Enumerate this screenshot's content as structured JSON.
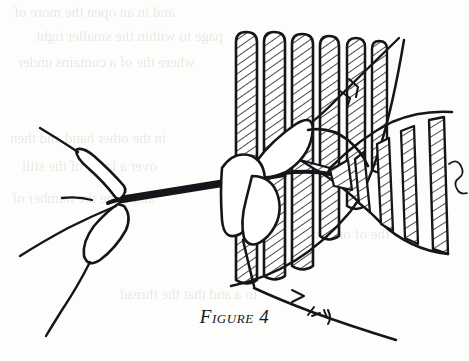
{
  "page": {
    "width": 469,
    "height": 361,
    "paper_color": "#fdfdfc",
    "ink_color": "#16161a",
    "hatch_color": "#2a2a2c"
  },
  "figure": {
    "caption": "Figure 4",
    "caption_number": "4",
    "caption_word": "Figure",
    "alt": "Line drawing of two hands pulling a dark cord through a row of hatched vertical rods",
    "elements": {
      "comb_rods_label": "vertical hatched rods",
      "fan_panel_label": "fanned hatched panel",
      "cord_label": "dark cord",
      "left_hand_label": "left hand fingers",
      "right_hand_label": "right hand fingers",
      "bristle_label": "bristle tick marks",
      "squiggle_label": "loose thread squiggle"
    }
  },
  "ghost_text": {
    "note": "faint bleed-through text from reverse of page",
    "lines": [
      {
        "text": "and  in  an  open  the  more  of",
        "x": 14,
        "y": 4,
        "size": 15
      },
      {
        "text": "page  to  within  the  smaller  tight",
        "x": 36,
        "y": 28,
        "size": 15
      },
      {
        "text": "where  the  of  a  contains  under",
        "x": 18,
        "y": 54,
        "size": 15
      },
      {
        "text": "in  the  other  hand  and  then",
        "x": 10,
        "y": 130,
        "size": 15
      },
      {
        "text": "over  a  large  of  the  still",
        "x": 22,
        "y": 158,
        "size": 15
      },
      {
        "text": "and  to  be  the  number  of",
        "x": 12,
        "y": 190,
        "size": 15
      },
      {
        "text": "to  a  and  that  the  thread",
        "x": 120,
        "y": 286,
        "size": 15
      },
      {
        "text": "the  of  one  so  it",
        "x": 300,
        "y": 226,
        "size": 15
      }
    ]
  }
}
